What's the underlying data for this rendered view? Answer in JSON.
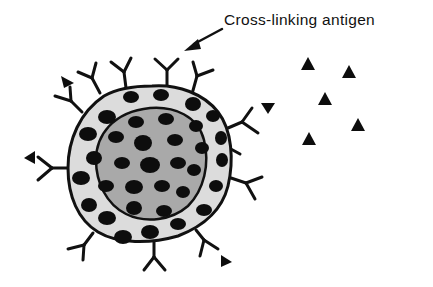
{
  "figure": {
    "label": "Cross-linking antigen",
    "colors": {
      "outline": "#111111",
      "outer_ring": "#dcdcdc",
      "inner_core": "#a9a9a9",
      "granules": "#0d0d0d",
      "antigen": "#0d0d0d"
    },
    "elements": {
      "cell": "B cell with surface antibodies",
      "antibodies_count": 16,
      "bound_antigens_count": 6,
      "free_antigens_count": 5
    }
  }
}
